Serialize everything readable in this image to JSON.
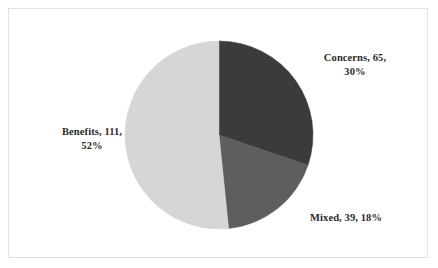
{
  "chart_data": {
    "type": "pie",
    "title": "",
    "categories": [
      "Concerns",
      "Mixed",
      "Benefits"
    ],
    "values": [
      65,
      39,
      111
    ],
    "percentages": [
      30,
      18,
      52
    ],
    "total": 215,
    "legend": "none",
    "grid": false,
    "slices": [
      {
        "name": "Concerns",
        "value": 65,
        "percent": 30,
        "color": "#3b3b3b",
        "start_angle_deg": 0,
        "end_angle_deg": 108,
        "label_line1": "Concerns, 65,",
        "label_line2": "30%"
      },
      {
        "name": "Mixed",
        "value": 39,
        "percent": 18,
        "color": "#5e5e5e",
        "start_angle_deg": 108,
        "end_angle_deg": 173,
        "label_line1": "Mixed, 39, 18%",
        "label_line2": ""
      },
      {
        "name": "Benefits",
        "value": 111,
        "percent": 52,
        "color": "#d6d6d6",
        "start_angle_deg": 173,
        "end_angle_deg": 360,
        "label_line1": "Benefits, 111,",
        "label_line2": "52%"
      }
    ]
  },
  "frame": {
    "border_color": "#e2e2e2",
    "background_color": "#ffffff"
  },
  "labels": {
    "concerns": {
      "line1": "Concerns, 65,",
      "line2": "30%"
    },
    "benefits": {
      "line1": "Benefits, 111,",
      "line2": "52%"
    },
    "mixed": {
      "line1": "Mixed, 39, 18%"
    }
  }
}
